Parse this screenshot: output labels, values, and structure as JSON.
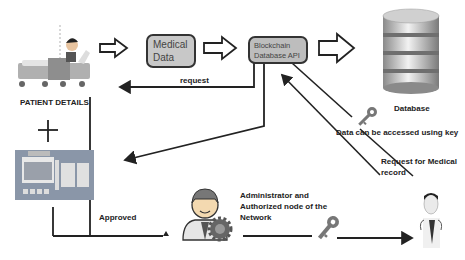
{
  "nodes": {
    "patient": {
      "label": "PATIENT DETAILS",
      "icon": "patient-in-bed-icon"
    },
    "hospital": {
      "icon": "hospital-building-icon",
      "sign": "HOSPITAL"
    },
    "medical_data": {
      "label_line1": "Medical",
      "label_line2": "Data"
    },
    "blockchain_api": {
      "label_line1": "Blockchain",
      "label_line2": "Database API"
    },
    "database": {
      "label": "Database",
      "icon": "database-cylinder-icon"
    },
    "administrator": {
      "label_line1": "Administrator and",
      "label_line2": "Authorized node of the",
      "label_line3": "Network",
      "icon": "admin-gear-icon"
    },
    "doctor": {
      "icon": "doctor-icon"
    }
  },
  "edges": {
    "request": "request",
    "data_access": "Data can be accessed using key",
    "record_request_line1": "Request for Medical",
    "record_request_line2": "record",
    "approved": "Approved"
  },
  "symbols": {
    "plus": "+",
    "key": "key-icon"
  },
  "colors": {
    "box_fill": "#c8c8c8",
    "stroke": "#222222",
    "hospital": "#8a96a8",
    "gear": "#555555"
  }
}
